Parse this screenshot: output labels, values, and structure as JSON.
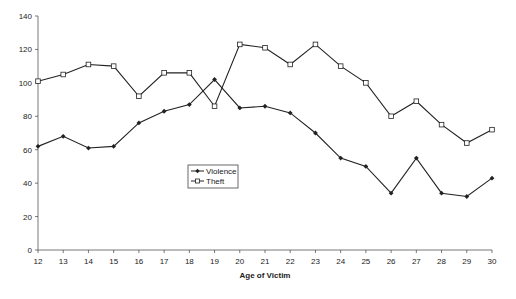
{
  "chart_data": {
    "type": "line",
    "title": "",
    "xlabel": "Age of Victim",
    "ylabel": "",
    "x": [
      12,
      13,
      14,
      15,
      16,
      17,
      18,
      19,
      20,
      21,
      22,
      23,
      24,
      25,
      26,
      27,
      28,
      29,
      30
    ],
    "xlim": [
      12,
      30
    ],
    "ylim": [
      0,
      140
    ],
    "yticks": [
      0,
      20,
      40,
      60,
      80,
      100,
      120,
      140
    ],
    "grid": false,
    "legend_position": "center (inside plot, lower-middle)",
    "series": [
      {
        "name": "Violence",
        "marker": "filled-diamond",
        "color": "#222222",
        "values": [
          62,
          68,
          61,
          62,
          76,
          83,
          87,
          102,
          85,
          86,
          82,
          70,
          55,
          50,
          34,
          55,
          34,
          32,
          43
        ]
      },
      {
        "name": "Theft",
        "marker": "open-square",
        "color": "#222222",
        "values": [
          101,
          105,
          111,
          110,
          92,
          106,
          106,
          86,
          123,
          121,
          111,
          123,
          110,
          100,
          80,
          89,
          75,
          64,
          72
        ]
      }
    ]
  },
  "legend": {
    "items": [
      {
        "label": "Violence"
      },
      {
        "label": "Theft"
      }
    ]
  },
  "axes": {
    "x_title": "Age of Victim"
  }
}
